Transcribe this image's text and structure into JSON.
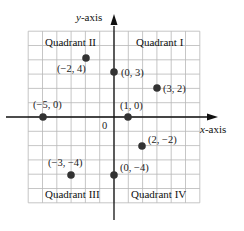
{
  "diagram": {
    "type": "coordinate-plane",
    "axes": {
      "x_label_var": "x",
      "x_label_suffix": "-axis",
      "y_label_var": "y",
      "y_label_suffix": "-axis",
      "origin_label": "0",
      "grid_range": [
        -6,
        6
      ]
    },
    "quadrants": {
      "q1": "Quadrant I",
      "q2": "Quadrant II",
      "q3": "Quadrant III",
      "q4": "Quadrant IV"
    },
    "points": [
      {
        "x": -2,
        "y": 4,
        "label": "(−2, 4)"
      },
      {
        "x": 0,
        "y": 3,
        "label": "(0, 3)"
      },
      {
        "x": 3,
        "y": 2,
        "label": "(3, 2)"
      },
      {
        "x": -5,
        "y": 0,
        "label": "(−5, 0)"
      },
      {
        "x": 1,
        "y": 0,
        "label": "(1, 0)"
      },
      {
        "x": 2,
        "y": -2,
        "label": "(2, −2)"
      },
      {
        "x": -3,
        "y": -4,
        "label": "(−3, −4)"
      },
      {
        "x": 0,
        "y": -4,
        "label": "(0, −4)"
      }
    ],
    "colors": {
      "grid": "#b8b8b8",
      "axis": "#111111",
      "point": "#333333"
    }
  }
}
